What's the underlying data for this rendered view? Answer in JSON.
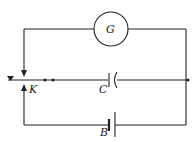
{
  "diagram": {
    "type": "circuit",
    "components": {
      "galvanometer": {
        "label": "G"
      },
      "key": {
        "label": "K"
      },
      "capacitor": {
        "label": "C"
      },
      "battery": {
        "label": "B"
      }
    },
    "colors": {
      "line": "#222222",
      "background": "#ffffff"
    }
  }
}
